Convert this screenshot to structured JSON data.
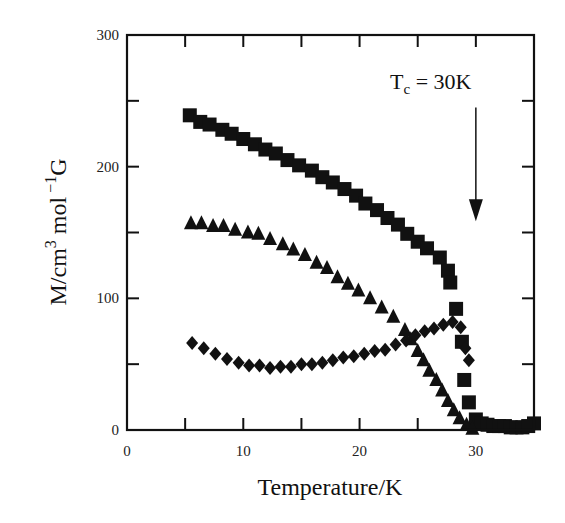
{
  "chart_data": {
    "type": "scatter",
    "title": "",
    "xlabel": "Temperature/K",
    "ylabel": "M/cm³ mol⁻¹ G",
    "ylabel_parts": {
      "base": "M/cm",
      "sup1": "3",
      "mid": " mol",
      "sup2": " −1",
      "end": "G"
    },
    "xlim": [
      0,
      35
    ],
    "ylim": [
      0,
      300
    ],
    "x_ticks": [
      0,
      5,
      10,
      15,
      20,
      25,
      30
    ],
    "x_tick_labels": [
      "0",
      "10",
      "20",
      "30"
    ],
    "x_tick_label_values": [
      0,
      10,
      20,
      30
    ],
    "y_ticks": [
      0,
      50,
      100,
      150,
      200,
      250,
      300
    ],
    "y_tick_labels": [
      "0",
      "100",
      "200",
      "300"
    ],
    "y_tick_label_values": [
      0,
      100,
      200,
      300
    ],
    "grid": false,
    "legend": null,
    "annotations": [
      {
        "text_main": "T",
        "text_sub": "c",
        "text_rest": " =  30K",
        "x": 30,
        "y": 275,
        "arrow_from": [
          30,
          245
        ],
        "arrow_to": [
          30,
          160
        ]
      }
    ],
    "series": [
      {
        "name": "squares",
        "marker": "square",
        "color": "#111111",
        "x": [
          5.4,
          6.3,
          7.1,
          8.2,
          9.0,
          10.0,
          11.0,
          11.9,
          12.8,
          13.8,
          14.8,
          15.9,
          16.8,
          17.7,
          18.7,
          19.7,
          20.5,
          21.5,
          22.4,
          23.3,
          24.1,
          25.0,
          25.8,
          26.9,
          27.6,
          27.8,
          28.3,
          28.8,
          29.0,
          29.4,
          30.0,
          30.5,
          31.0,
          31.5,
          32.0,
          32.5,
          33.0,
          33.5,
          34.0,
          34.5,
          35.0
        ],
        "y": [
          239,
          234,
          232,
          228,
          225,
          221,
          217,
          213,
          210,
          205,
          201,
          197,
          192,
          188,
          183,
          178,
          172,
          167,
          161,
          156,
          149,
          143,
          138,
          131,
          121,
          112,
          92,
          67,
          38,
          21,
          8,
          5,
          4,
          3,
          3,
          3,
          2,
          2,
          2,
          3,
          5
        ]
      },
      {
        "name": "triangles",
        "marker": "triangle",
        "color": "#111111",
        "x": [
          5.5,
          6.4,
          7.4,
          8.3,
          9.3,
          10.4,
          11.3,
          12.3,
          13.4,
          14.3,
          15.3,
          16.3,
          17.2,
          18.1,
          19.0,
          19.9,
          20.9,
          21.9,
          22.9,
          23.9,
          24.4,
          25.0,
          25.5,
          26.0,
          26.6,
          27.1,
          27.6,
          28.1,
          28.6,
          29.2,
          29.7
        ],
        "y": [
          157,
          157,
          155,
          155,
          152,
          150,
          149,
          145,
          141,
          137,
          133,
          127,
          123,
          116,
          111,
          106,
          100,
          93,
          86,
          76,
          69,
          60,
          53,
          45,
          38,
          30,
          22,
          15,
          9,
          4,
          1
        ]
      },
      {
        "name": "diamonds",
        "marker": "diamond",
        "color": "#111111",
        "x": [
          5.6,
          6.6,
          7.6,
          8.6,
          9.6,
          10.5,
          11.4,
          12.3,
          13.2,
          14.1,
          15.0,
          15.9,
          16.8,
          17.7,
          18.6,
          19.5,
          20.4,
          21.3,
          22.2,
          23.1,
          24.0,
          24.8,
          25.6,
          26.4,
          27.2,
          28.0,
          28.7,
          29.1,
          29.4
        ],
        "y": [
          66,
          62,
          58,
          54,
          51,
          49,
          49,
          47,
          48,
          48,
          50,
          50,
          51,
          53,
          55,
          56,
          58,
          60,
          61,
          65,
          68,
          72,
          75,
          77,
          80,
          82,
          78,
          62,
          53
        ]
      }
    ]
  }
}
